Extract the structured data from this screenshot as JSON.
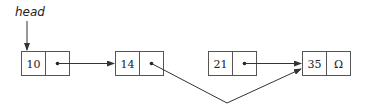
{
  "diagram": {
    "type": "linked-list",
    "head_label": "head",
    "nodes": [
      {
        "value": "10",
        "next": "dot"
      },
      {
        "value": "14",
        "next": "dot"
      },
      {
        "value": "21",
        "next": "dot"
      },
      {
        "value": "35",
        "next": "Ω"
      }
    ],
    "edges": [
      {
        "from": "head",
        "to": "10"
      },
      {
        "from": "10",
        "to": "14"
      },
      {
        "from": "14",
        "to": "35"
      },
      {
        "from": "21",
        "to": "35"
      }
    ],
    "colors": {
      "stroke": "#333333",
      "box": "#555555",
      "background": "#ffffff"
    }
  }
}
